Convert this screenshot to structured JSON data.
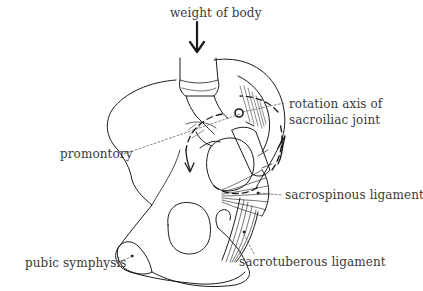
{
  "diagram": {
    "type": "anatomical illustration",
    "labels": {
      "weight": "weight of body",
      "rotation_axis": [
        "rotation axis of",
        "sacroiliac joint"
      ],
      "promontory": "promontory",
      "sacrospinous": "sacrospinous ligament",
      "pubic_symphysis": "pubic symphysis",
      "sacrotuberous": "sacrotuberous ligament"
    },
    "colors": {
      "line": "#1a1a1a",
      "text": "#3a3a3a",
      "background": "#ffffff"
    }
  }
}
